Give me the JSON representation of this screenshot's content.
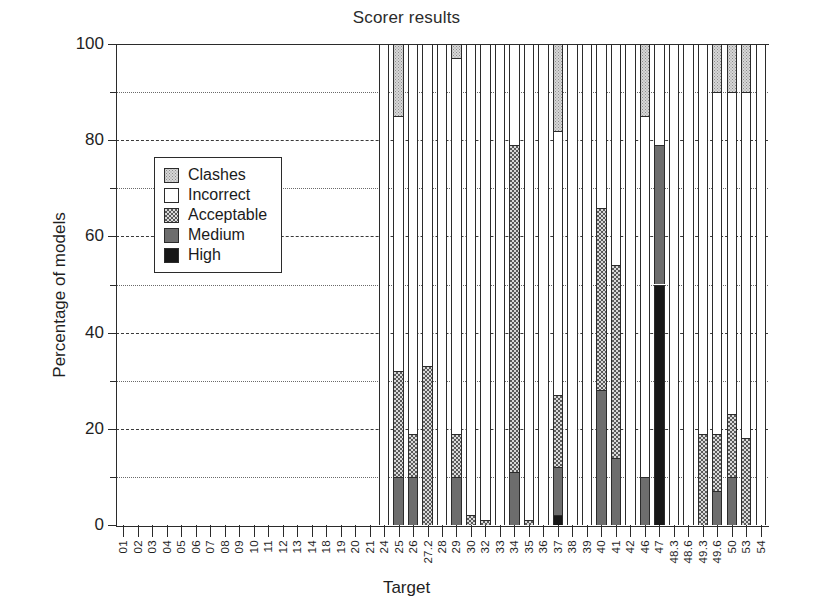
{
  "chart_data": {
    "type": "bar",
    "title": "Scorer results",
    "xlabel": "Target",
    "ylabel": "Percentage of models",
    "ylim": [
      0,
      100
    ],
    "yticks_major": [
      0,
      20,
      40,
      60,
      80,
      100
    ],
    "yticks_minor": [
      10,
      30,
      50,
      70,
      90
    ],
    "grid": "horizontal dashed at majors, dotted at minors",
    "legend_position": "upper-left inside axes",
    "stacked": true,
    "stack_order_bottom_to_top": [
      "High",
      "Medium",
      "Acceptable",
      "Incorrect",
      "Clashes"
    ],
    "legend": [
      {
        "label": "Clashes",
        "fill": "light-dotted-gray"
      },
      {
        "label": "Incorrect",
        "fill": "white"
      },
      {
        "label": "Acceptable",
        "fill": "checker-gray"
      },
      {
        "label": "Medium",
        "fill": "mid-gray"
      },
      {
        "label": "High",
        "fill": "black"
      }
    ],
    "colors": {
      "high": "#171717",
      "medium": "#6d6d6d",
      "acceptable": "#d9d9d9",
      "incorrect": "#ffffff",
      "clashes": "#d7d7d7",
      "axis": "#2b2b2b"
    },
    "categories": [
      "01",
      "02",
      "03",
      "04",
      "05",
      "06",
      "07",
      "08",
      "09",
      "10",
      "11",
      "12",
      "13",
      "14",
      "18",
      "19",
      "20",
      "21",
      "24",
      "25",
      "26",
      "27.2",
      "28",
      "29",
      "30",
      "32",
      "33",
      "34",
      "35",
      "36",
      "37",
      "38",
      "39",
      "40",
      "41",
      "42",
      "46",
      "47",
      "48.3",
      "48.6",
      "49.3",
      "49.6",
      "50",
      "53",
      "54"
    ],
    "series": [
      {
        "name": "High",
        "values": [
          0,
          0,
          0,
          0,
          0,
          0,
          0,
          0,
          0,
          0,
          0,
          0,
          0,
          0,
          0,
          0,
          0,
          0,
          0,
          0,
          0,
          0,
          0,
          0,
          0,
          0,
          0,
          0,
          0,
          0,
          2,
          0,
          0,
          0,
          0,
          0,
          0,
          50,
          0,
          0,
          0,
          0,
          0,
          0,
          0
        ]
      },
      {
        "name": "Medium",
        "values": [
          0,
          0,
          0,
          0,
          0,
          0,
          0,
          0,
          0,
          0,
          0,
          0,
          0,
          0,
          0,
          0,
          0,
          0,
          0,
          10,
          10,
          0,
          0,
          10,
          0,
          0,
          0,
          11,
          0,
          0,
          10,
          0,
          0,
          28,
          14,
          0,
          10,
          29,
          0,
          0,
          0,
          7,
          10,
          0,
          0
        ]
      },
      {
        "name": "Acceptable",
        "values": [
          0,
          0,
          0,
          0,
          0,
          0,
          0,
          0,
          0,
          0,
          0,
          0,
          0,
          0,
          0,
          0,
          0,
          0,
          0,
          22,
          9,
          33,
          0,
          9,
          2,
          1,
          0,
          68,
          1,
          0,
          15,
          0,
          0,
          38,
          40,
          0,
          0,
          0,
          0,
          0,
          19,
          12,
          13,
          18,
          0
        ]
      },
      {
        "name": "Incorrect",
        "values": [
          0,
          0,
          0,
          0,
          0,
          0,
          0,
          0,
          0,
          0,
          0,
          0,
          0,
          0,
          0,
          0,
          0,
          0,
          100,
          53,
          81,
          67,
          100,
          78,
          98,
          99,
          100,
          21,
          99,
          100,
          55,
          100,
          100,
          34,
          46,
          100,
          75,
          21,
          100,
          100,
          81,
          71,
          67,
          72,
          100
        ]
      },
      {
        "name": "Clashes",
        "values": [
          0,
          0,
          0,
          0,
          0,
          0,
          0,
          0,
          0,
          0,
          0,
          0,
          0,
          0,
          0,
          0,
          0,
          0,
          0,
          15,
          0,
          0,
          0,
          3,
          0,
          0,
          0,
          0,
          0,
          0,
          18,
          0,
          0,
          0,
          0,
          0,
          15,
          0,
          0,
          0,
          0,
          10,
          10,
          10,
          0
        ]
      }
    ],
    "bars_present_from": "24",
    "note_empty_categories": [
      "01",
      "02",
      "03",
      "04",
      "05",
      "06",
      "07",
      "08",
      "09",
      "10",
      "11",
      "12",
      "13",
      "14",
      "18",
      "19",
      "20",
      "21"
    ]
  }
}
